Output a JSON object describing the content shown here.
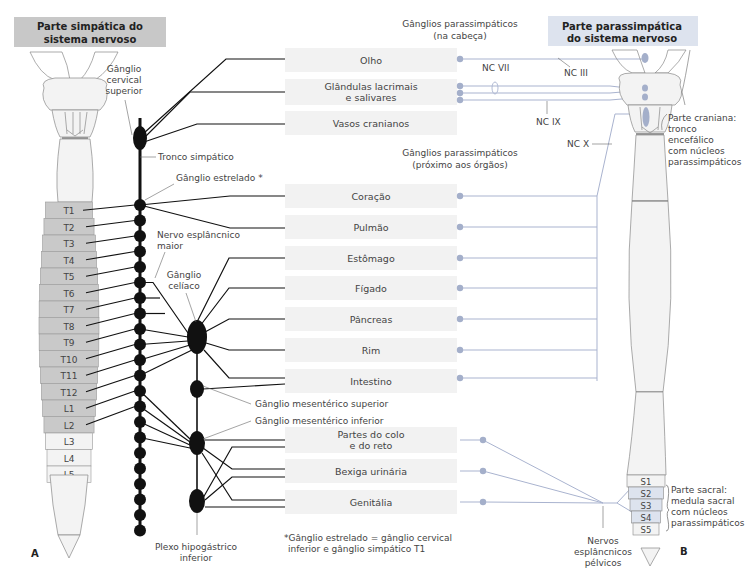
{
  "headers": {
    "sympathetic": [
      "Parte simpática do",
      "sistema nervoso"
    ],
    "parasympathetic": [
      "Parte parassimpática",
      "do sistema nervoso"
    ]
  },
  "colors": {
    "sympathetic_header_bg": "#c8c8c8",
    "parasympathetic_header_bg": "#dde3ee",
    "organ_box_bg": "#f2f2f2",
    "sympathetic_segment_fill": "#c9c9c9",
    "sacral_segment_fill": "#dde3ee",
    "parasympathetic_line": "#a9b3cf",
    "parasympathetic_dot": "#a4afca",
    "sympathetic_line": "#111111"
  },
  "organs": [
    {
      "id": "olho",
      "lines": [
        "Olho"
      ]
    },
    {
      "id": "glandulas",
      "lines": [
        "Glândulas lacrimais",
        "e salivares"
      ]
    },
    {
      "id": "vasos",
      "lines": [
        "Vasos cranianos"
      ]
    },
    {
      "id": "coracao",
      "lines": [
        "Coração"
      ]
    },
    {
      "id": "pulmao",
      "lines": [
        "Pulmão"
      ]
    },
    {
      "id": "estomago",
      "lines": [
        "Estômago"
      ]
    },
    {
      "id": "figado",
      "lines": [
        "Fígado"
      ]
    },
    {
      "id": "pancreas",
      "lines": [
        "Pâncreas"
      ]
    },
    {
      "id": "rim",
      "lines": [
        "Rim"
      ]
    },
    {
      "id": "intestino",
      "lines": [
        "Intestino"
      ]
    },
    {
      "id": "colo",
      "lines": [
        "Partes do colo",
        "e do reto"
      ]
    },
    {
      "id": "bexiga",
      "lines": [
        "Bexiga urinária"
      ]
    },
    {
      "id": "genitalia",
      "lines": [
        "Genitália"
      ]
    }
  ],
  "spinal_segments_left": [
    "T1",
    "T2",
    "T3",
    "T4",
    "T5",
    "T6",
    "T7",
    "T8",
    "T9",
    "T10",
    "T11",
    "T12",
    "L1",
    "L2",
    "L3",
    "L4",
    "L5"
  ],
  "sympathetic_segments": [
    "T1",
    "T2",
    "T3",
    "T4",
    "T5",
    "T6",
    "T7",
    "T8",
    "T9",
    "T10",
    "T11",
    "T12",
    "L1",
    "L2"
  ],
  "sacral_segments": [
    "S1",
    "S2",
    "S3",
    "S4",
    "S5"
  ],
  "parasympathetic_sacral_segments": [
    "S2",
    "S3",
    "S4"
  ],
  "labels": {
    "ganglio_cervical_superior": [
      "Gânglio",
      "cervical",
      "superior"
    ],
    "tronco_simpatico": "Tronco simpático",
    "ganglio_estrelado": "Gânglio estrelado *",
    "nervo_esplancnico_maior": [
      "Nervo esplâncnico",
      "maior"
    ],
    "ganglio_celiaco": [
      "Gânglio",
      "celíaco"
    ],
    "ganglio_mesenterico_superior": "Gânglio mesentérico superior",
    "ganglio_mesenterico_inferior": "Gânglio mesentérico inferior",
    "plexo_hipogastrico_inferior": [
      "Plexo hipogástrico",
      "inferior"
    ],
    "footnote": [
      "*Gânglio estrelado = gânglio cervical",
      "inferior e gânglio simpático T1"
    ],
    "ganglios_cabeca": [
      "Gânglios parassimpáticos",
      "(na cabeça)"
    ],
    "ganglios_orgaos": [
      "Gânglios parassimpáticos",
      "(próximo aos órgãos)"
    ],
    "nc_iii": "NC III",
    "nc_vii": "NC VII",
    "nc_ix": "NC IX",
    "nc_x": "NC X",
    "parte_craniana": [
      "Parte craniana:",
      "tronco",
      "encefálico",
      "com núcleos",
      "parassimpáticos"
    ],
    "parte_sacral": [
      "Parte sacral:",
      "medula sacral",
      "com núcleos",
      "parassimpáticos"
    ],
    "nervos_esplancnicos_pelvicos": [
      "Nervos",
      "esplâncnicos",
      "pélvicos"
    ],
    "panel_a": "A",
    "panel_b": "B"
  }
}
